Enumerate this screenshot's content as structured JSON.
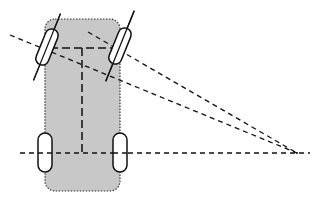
{
  "diagram": {
    "colors": {
      "body_fill": "#c8c8c8",
      "stroke": "#111111",
      "wheel_fill": "#ffffff"
    },
    "body": {
      "x": 45,
      "y": 19,
      "w": 75,
      "h": 172,
      "rx": 10
    },
    "wheels": [
      {
        "name": "front-left",
        "cx": 47,
        "cy": 47,
        "angle": 22
      },
      {
        "name": "front-right",
        "cx": 120,
        "cy": 46,
        "angle": 22
      },
      {
        "name": "rear-left",
        "cx": 45,
        "cy": 153,
        "angle": 0
      },
      {
        "name": "rear-right",
        "cx": 120,
        "cy": 153,
        "angle": 0
      }
    ],
    "turning_center": {
      "x": 297,
      "y": 153
    }
  }
}
